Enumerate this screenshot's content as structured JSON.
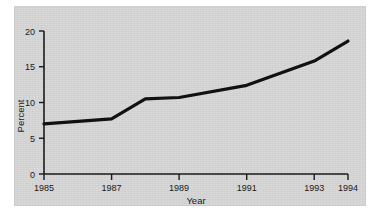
{
  "chart_data": {
    "type": "line",
    "title": "",
    "xlabel": "Year",
    "ylabel": "Percent",
    "x": [
      1985,
      1987,
      1988,
      1989,
      1991,
      1993,
      1994
    ],
    "values": [
      7.0,
      7.7,
      10.5,
      10.7,
      12.4,
      15.8,
      18.6
    ],
    "series": [
      {
        "name": "Percent",
        "x": [
          1985,
          1987,
          1988,
          1989,
          1991,
          1993,
          1994
        ],
        "values": [
          7.0,
          7.7,
          10.5,
          10.7,
          12.4,
          15.8,
          18.6
        ]
      }
    ],
    "xlim": [
      1985,
      1994
    ],
    "ylim": [
      0,
      20
    ],
    "xticks": [
      1985,
      1987,
      1989,
      1991,
      1993,
      1994
    ],
    "xtick_labels": [
      "1985",
      "1987",
      "1989",
      "1991",
      "1993",
      "1994"
    ],
    "yticks": [
      0,
      5,
      10,
      15,
      20
    ],
    "ytick_labels": [
      "0",
      "5",
      "10",
      "15",
      "20"
    ],
    "grid": false,
    "legend": "none",
    "line_color": "#111111",
    "background_color": "#d7d7d7",
    "page_color": "#ffffff"
  }
}
